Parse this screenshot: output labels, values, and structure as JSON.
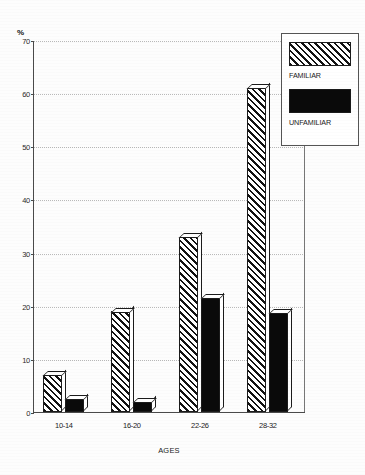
{
  "chart_data": {
    "type": "bar",
    "title": "",
    "xlabel": "AGES",
    "ylabel": "%",
    "categories": [
      "10-14",
      "16-20",
      "22-26",
      "28-32"
    ],
    "series": [
      {
        "name": "FAMILIAR",
        "values": [
          7,
          19,
          33,
          61
        ]
      },
      {
        "name": "UNFAMILIAR",
        "values": [
          2.5,
          2,
          21.5,
          18.7
        ]
      }
    ],
    "ylim": [
      0,
      70
    ],
    "yticks": [
      0,
      10,
      20,
      30,
      40,
      50,
      60,
      70
    ],
    "ytick_labels": [
      "0",
      "10",
      "20",
      "30",
      "40",
      "50",
      "60",
      "70"
    ],
    "grid": true,
    "grid_orientation": "horizontal",
    "legend_position": "top-right",
    "style": "monochrome-3d-bars",
    "series_fill": [
      "diagonal-hatch",
      "solid-black"
    ]
  },
  "legend": {
    "items": [
      {
        "label": "FAMILIAR",
        "swatch": "hatch-swatch"
      },
      {
        "label": "UNFAMILIAR",
        "swatch": "solid-swatch"
      }
    ]
  },
  "colors": {
    "ink": "#1a1a1a",
    "grid": "#b9b9b9",
    "axis": "#4a4a4a",
    "background": "#ffffff"
  }
}
